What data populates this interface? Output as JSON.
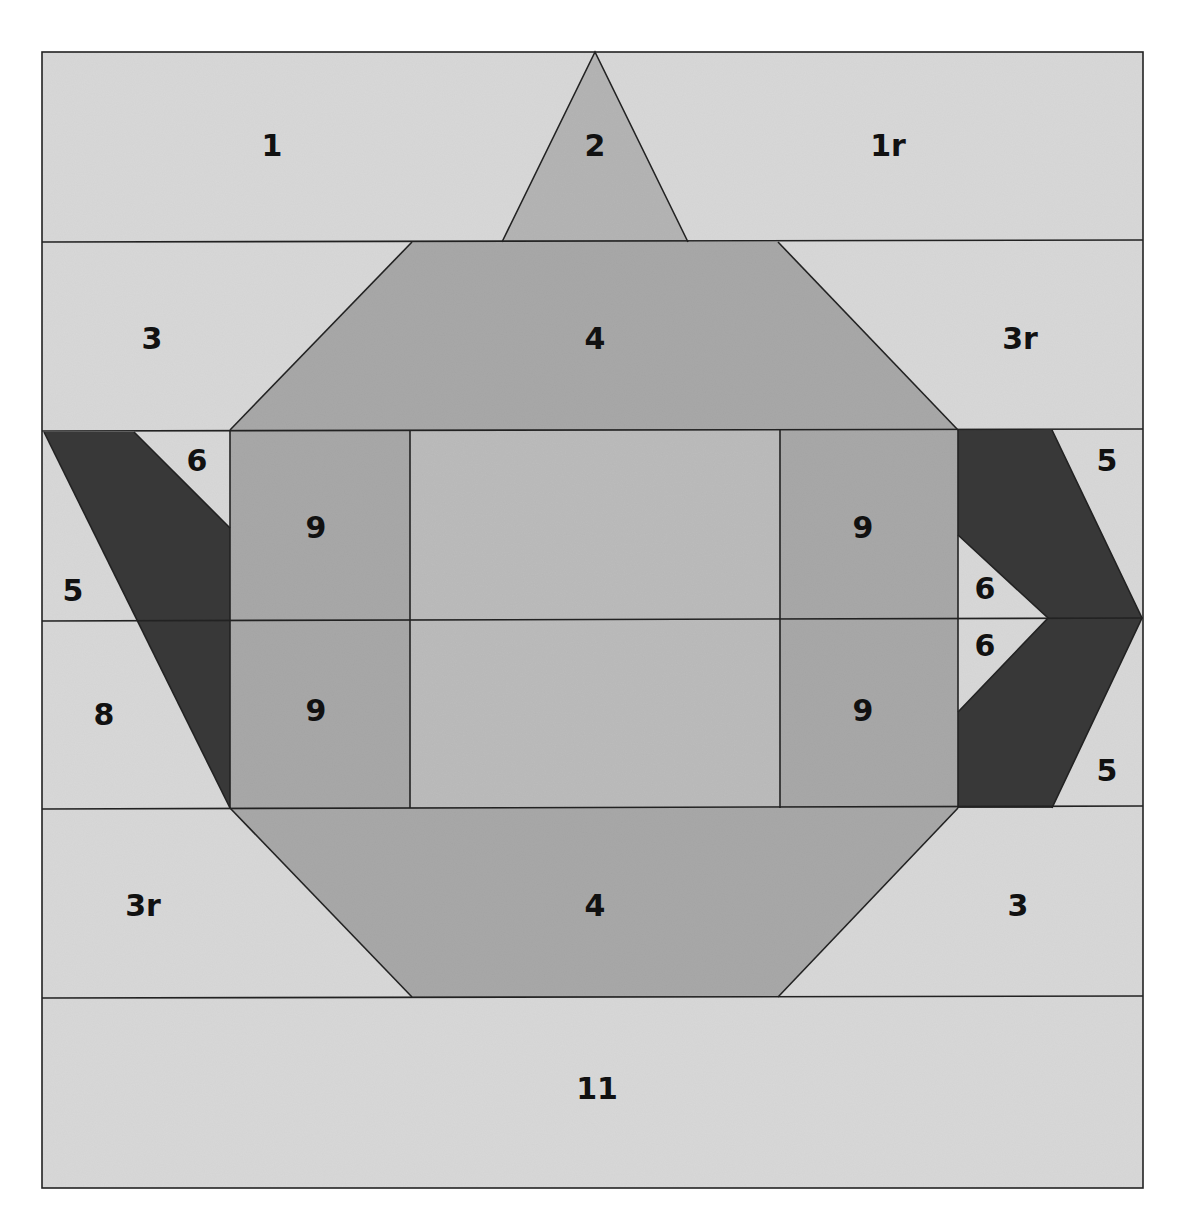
{
  "diagram": {
    "type": "quilt-block-piecing-diagram",
    "colors": {
      "background": "#d9d9d9",
      "pot_medium": "#a9a9a9",
      "pot_center": "#bcbcbc",
      "lid_knob": "#b5b5b5",
      "dark_spout_handle": "#3a3a3a",
      "seam_line": "#222222",
      "page": "#ffffff"
    },
    "rows": [
      {
        "name": "row-1",
        "pieces": [
          "1",
          "2",
          "1r"
        ]
      },
      {
        "name": "row-2",
        "pieces": [
          "3",
          "4",
          "3r"
        ]
      },
      {
        "name": "row-3",
        "pieces": [
          "6",
          "5",
          "9",
          "9",
          "6",
          "5"
        ]
      },
      {
        "name": "row-4",
        "pieces": [
          "8",
          "9",
          "9",
          "6",
          "5"
        ]
      },
      {
        "name": "row-5",
        "pieces": [
          "3r",
          "4",
          "3"
        ]
      },
      {
        "name": "row-6",
        "pieces": [
          "11"
        ]
      }
    ],
    "labels": {
      "p1": "1",
      "p2": "2",
      "p1r": "1r",
      "p3_top": "3",
      "p4_top": "4",
      "p3r_top": "3r",
      "p6_left": "6",
      "p5_left": "5",
      "p8_left": "8",
      "p9_ul": "9",
      "p9_ll": "9",
      "p9_ur": "9",
      "p9_lr": "9",
      "p5_right_top": "5",
      "p6_right_top": "6",
      "p6_right_bottom": "6",
      "p5_right_bottom": "5",
      "p3r_bottom": "3r",
      "p4_bottom": "4",
      "p3_bottom": "3",
      "p11": "11"
    }
  }
}
